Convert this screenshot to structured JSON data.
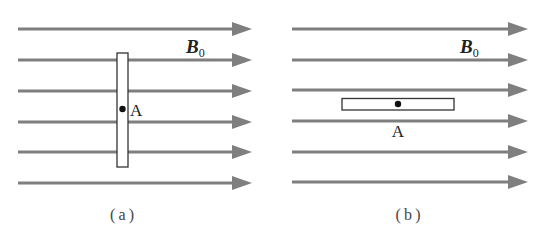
{
  "figure": {
    "colors": {
      "field_line": "#7f7f7f",
      "stroke": "#333333",
      "dot": "#111111",
      "background": "#ffffff"
    },
    "panels": [
      {
        "id": "a",
        "caption": "( a )",
        "field_label": "B",
        "field_subscript": "0",
        "point_label": "A",
        "rod_orientation": "vertical",
        "field_lines_y": [
          29,
          60,
          91,
          122,
          152,
          183
        ],
        "field_line_x_start": 18,
        "field_line_x_end": 252
      },
      {
        "id": "b",
        "caption": "( b )",
        "field_label": "B",
        "field_subscript": "0",
        "point_label": "A",
        "rod_orientation": "horizontal",
        "field_lines_y": [
          29,
          60,
          90,
          121,
          152,
          182
        ],
        "field_line_x_start": 292,
        "field_line_x_end": 528
      }
    ]
  }
}
